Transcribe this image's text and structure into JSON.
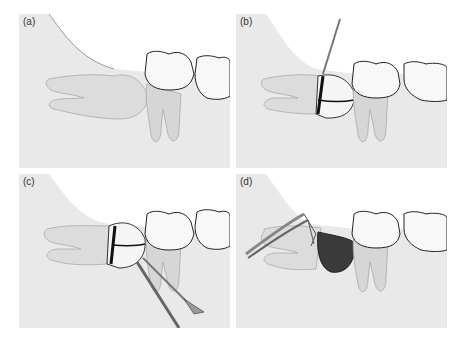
{
  "figure": {
    "panels": [
      {
        "id": "a",
        "label": "(a)",
        "description": "Impacted third molar, unaltered"
      },
      {
        "id": "b",
        "label": "(b)",
        "description": "Bur sectioning the crown"
      },
      {
        "id": "c",
        "label": "(c)",
        "description": "Elevator separating crown segments"
      },
      {
        "id": "d",
        "label": "(d)",
        "description": "Root removal with forceps, crown removed"
      }
    ],
    "colors": {
      "background": "#e9e9e9",
      "tooth": "#f7f7f7",
      "outline": "#222222",
      "gum": "#ffffff",
      "cut_line": "#111111",
      "socket": "#3a3a3a"
    }
  }
}
